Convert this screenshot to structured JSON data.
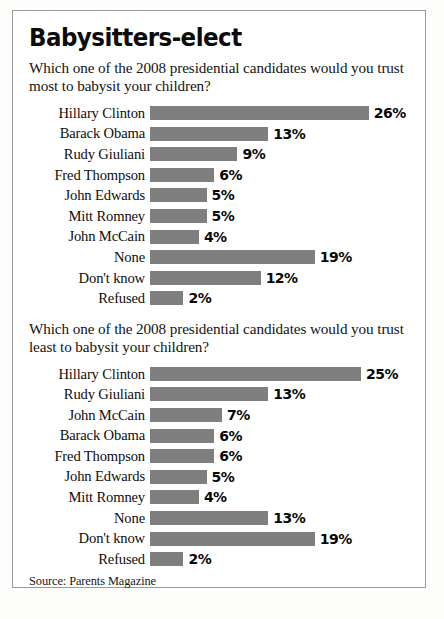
{
  "title": "Babysitters-elect",
  "source": "Source: Parents Magazine",
  "credit": "",
  "colors": {
    "bar": "#7f7f7f",
    "border": "#9b9b9b",
    "text": "#0e0e0e"
  },
  "sections": [
    {
      "question": "Which one of the 2008 presidential candidates would you trust most to babysit your children?"
    },
    {
      "question": "Which one of the 2008 presidential candidates would you trust least to babysit your children?"
    }
  ],
  "chart_data": [
    {
      "type": "bar",
      "orientation": "horizontal",
      "title": "Which one of the 2008 presidential candidates would you trust most to babysit your children?",
      "xlabel": "",
      "ylabel": "",
      "xlim": [
        0,
        26
      ],
      "grid": false,
      "legend": false,
      "categories": [
        "Hillary Clinton",
        "Barack Obama",
        "Rudy Giuliani",
        "Fred Thompson",
        "John Edwards",
        "Mitt Romney",
        "John McCain",
        "None",
        "Don't know",
        "Refused"
      ],
      "values": [
        26,
        13,
        9,
        6,
        5,
        5,
        4,
        19,
        12,
        2
      ],
      "value_labels": [
        "26%",
        "13%",
        "9%",
        "6%",
        "5%",
        "5%",
        "4%",
        "19%",
        "12%",
        "2%"
      ]
    },
    {
      "type": "bar",
      "orientation": "horizontal",
      "title": "Which one of the 2008 presidential candidates would you trust least to babysit your children?",
      "xlabel": "",
      "ylabel": "",
      "xlim": [
        0,
        25
      ],
      "grid": false,
      "legend": false,
      "categories": [
        "Hillary Clinton",
        "Rudy Giuliani",
        "John McCain",
        "Barack Obama",
        "Fred Thompson",
        "John Edwards",
        "Mitt Romney",
        "None",
        "Don't know",
        "Refused"
      ],
      "values": [
        25,
        13,
        7,
        6,
        6,
        5,
        4,
        13,
        19,
        2
      ],
      "value_labels": [
        "25%",
        "13%",
        "7%",
        "6%",
        "6%",
        "5%",
        "4%",
        "13%",
        "19%",
        "2%"
      ]
    }
  ]
}
